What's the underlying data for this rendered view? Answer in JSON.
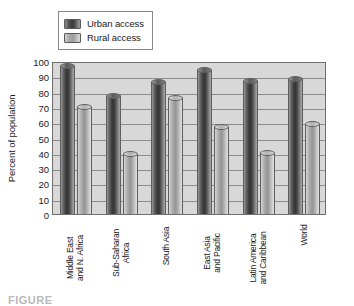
{
  "chart_data": {
    "type": "bar",
    "title": "",
    "xlabel": "",
    "ylabel": "Percent of population",
    "ylim": [
      0,
      100
    ],
    "ytick_step": 10,
    "yticks": [
      100,
      90,
      80,
      70,
      60,
      50,
      40,
      30,
      20,
      10,
      0
    ],
    "grid": true,
    "legend_position": "top-left",
    "categories": [
      "Middle East and N. Africa",
      "Sub-Saharan Africa",
      "South Asia",
      "East Asia and Pacific",
      "Latin America and Caribbean",
      "World"
    ],
    "category_lines": [
      [
        "Middle East",
        "and N. Africa"
      ],
      [
        "Sub-Saharan",
        "Africa"
      ],
      [
        "South Asia"
      ],
      [
        "East Asia",
        "and Pacific"
      ],
      [
        "Latin America",
        "and Caribbean"
      ],
      [
        "World"
      ]
    ],
    "series": [
      {
        "name": "Urban access",
        "color": "#3d3d3d",
        "values": [
          97,
          77,
          86,
          94,
          87,
          88
        ]
      },
      {
        "name": "Rural access",
        "color": "#a8a8a8",
        "values": [
          70,
          39,
          76,
          57,
          40,
          59
        ]
      }
    ]
  },
  "legend": {
    "items": [
      {
        "label": "Urban access",
        "swatch": "urban"
      },
      {
        "label": "Rural access",
        "swatch": "rural"
      }
    ]
  },
  "caption": {
    "text": "FIGURE"
  },
  "colors": {
    "urban": "#3d3d3d",
    "rural": "#a8a8a8",
    "plot_background": "#d8d8d8",
    "gridline": "#8c8c8c",
    "frame": "#6f6f6f"
  }
}
